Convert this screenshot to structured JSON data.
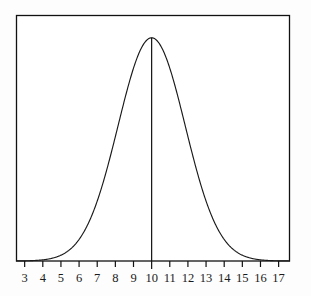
{
  "figure": {
    "background_color": "#fdfdfd",
    "plot_background_color": "#ffffff",
    "line_color": "#1a1a1a",
    "axis_color": "#111111"
  },
  "chart_data": {
    "type": "line",
    "title": "",
    "subtitle": "",
    "xlabel": "",
    "ylabel": "",
    "grid": false,
    "legend": "none",
    "annotations": [
      {
        "name": "mean-line",
        "type": "vertical-line",
        "x": 10,
        "label": ""
      }
    ],
    "curve": {
      "name": "normal-distribution",
      "distribution": "normal",
      "mean": 10,
      "sigma": 1.85,
      "peak_value": 1.0
    },
    "xlim": [
      2.55,
      17.6
    ],
    "ylim": [
      0,
      1.1
    ],
    "xticks": [
      3,
      4,
      5,
      6,
      7,
      8,
      9,
      10,
      11,
      12,
      13,
      14,
      15,
      16,
      17
    ],
    "xticklabels": [
      "3",
      "4",
      "5",
      "6",
      "7",
      "8",
      "9",
      "10",
      "11",
      "12",
      "13",
      "14",
      "15",
      "16",
      "17"
    ],
    "yticks": [],
    "yticklabels": [],
    "x": [
      3.0,
      3.25,
      3.5,
      3.75,
      4.0,
      4.25,
      4.5,
      4.75,
      5.0,
      5.25,
      5.5,
      5.75,
      6.0,
      6.25,
      6.5,
      6.75,
      7.0,
      7.25,
      7.5,
      7.75,
      8.0,
      8.25,
      8.5,
      8.75,
      9.0,
      9.25,
      9.5,
      9.75,
      10.0,
      10.25,
      10.5,
      10.75,
      11.0,
      11.25,
      11.5,
      11.75,
      12.0,
      12.25,
      12.5,
      12.75,
      13.0,
      13.25,
      13.5,
      13.75,
      14.0,
      14.25,
      14.5,
      14.75,
      15.0,
      15.25,
      15.5,
      15.75,
      16.0,
      16.25,
      16.5,
      16.75,
      17.0
    ],
    "y": [
      0.001,
      0.002,
      0.003,
      0.005,
      0.008,
      0.013,
      0.019,
      0.029,
      0.042,
      0.06,
      0.084,
      0.115,
      0.155,
      0.204,
      0.263,
      0.331,
      0.407,
      0.488,
      0.572,
      0.654,
      0.731,
      0.799,
      0.856,
      0.9,
      0.93,
      0.945,
      0.946,
      0.932,
      1.0,
      0.932,
      0.946,
      0.945,
      0.93,
      0.9,
      0.856,
      0.799,
      0.731,
      0.654,
      0.572,
      0.488,
      0.407,
      0.331,
      0.263,
      0.204,
      0.155,
      0.115,
      0.084,
      0.06,
      0.042,
      0.029,
      0.019,
      0.013,
      0.008,
      0.005,
      0.003,
      0.002,
      0.001
    ]
  }
}
